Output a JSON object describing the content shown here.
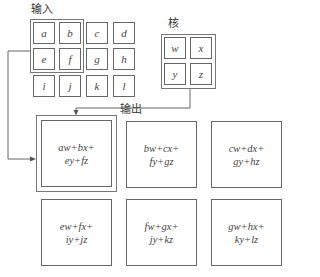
{
  "labels": {
    "input": "输入",
    "kernel": "核",
    "output": "输出"
  },
  "input_grid": [
    [
      "a",
      "b",
      "c",
      "d"
    ],
    [
      "e",
      "f",
      "g",
      "h"
    ],
    [
      "i",
      "j",
      "k",
      "l"
    ]
  ],
  "kernel_grid": [
    [
      "w",
      "x"
    ],
    [
      "y",
      "z"
    ]
  ],
  "output_grid": [
    [
      {
        "line1": "aw+bx+",
        "line2": "ey+fz"
      },
      {
        "line1": "bw+cx+",
        "line2": "fy+gz"
      },
      {
        "line1": "cw+dx+",
        "line2": "gy+hz"
      }
    ],
    [
      {
        "line1": "ew+fx+",
        "line2": "iy+jz"
      },
      {
        "line1": "fw+gx+",
        "line2": "jy+kz"
      },
      {
        "line1": "gw+hx+",
        "line2": "ky+lz"
      }
    ]
  ]
}
